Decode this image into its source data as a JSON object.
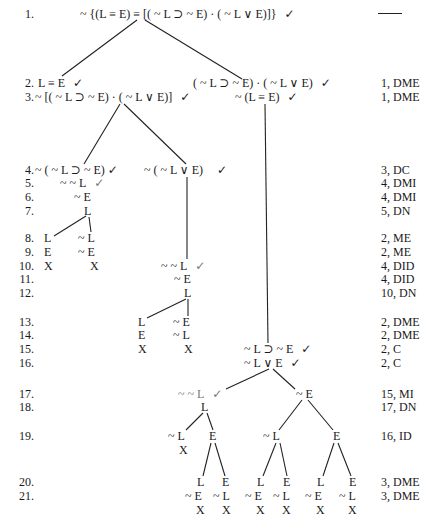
{
  "check_glyph": "✓",
  "rows": [
    {
      "n": "1.",
      "just": ""
    },
    {
      "n": "2.",
      "just": "1, DME"
    },
    {
      "n": "3.",
      "just": "1, DME"
    },
    {
      "n": "4.",
      "just": "3, DC"
    },
    {
      "n": "5.",
      "just": "4, DMI"
    },
    {
      "n": "6.",
      "just": "4, DMI"
    },
    {
      "n": "7.",
      "just": "5, DN"
    },
    {
      "n": "8.",
      "just": "2, ME"
    },
    {
      "n": "9.",
      "just": "2, ME"
    },
    {
      "n": "10.",
      "just": "4, DID"
    },
    {
      "n": "11.",
      "just": "4, DID"
    },
    {
      "n": "12.",
      "just": "10, DN"
    },
    {
      "n": "13.",
      "just": "2, DME"
    },
    {
      "n": "14.",
      "just": "2, DME"
    },
    {
      "n": "15.",
      "just": "2, C"
    },
    {
      "n": "16.",
      "just": "2, C"
    },
    {
      "n": "17.",
      "just": "15, MI"
    },
    {
      "n": "18.",
      "just": "17, DN"
    },
    {
      "n": "19.",
      "just": "16, ID"
    },
    {
      "n": "20.",
      "just": "3, DME"
    },
    {
      "n": "21.",
      "just": "3, DME"
    }
  ],
  "formulas": {
    "r1": "~ {(L ≡ E) ≡ [( ~ L ⊃ ~ E) · ( ~ L ∨ E)]}",
    "r2a": "L ≡ E",
    "r2b": "( ~ L ⊃ ~ E) · ( ~ L ∨ E)",
    "r3a": "~ [( ~ L ⊃ ~ E) · ( ~ L ∨ E)]",
    "r3b": "~ (L ≡ E)",
    "r4a": "~ ( ~ L ⊃ ~ E)",
    "r4b": "~ ( ~ L ∨ E)",
    "r5": "~ ~ L",
    "r6": "~ E",
    "r7": "L",
    "r8a": "L",
    "r8b": "~ L",
    "r9a": "E",
    "r9b": "~ E",
    "r10a": "X",
    "r10b": "X",
    "r10c": "~ ~ L",
    "r11": "~ E",
    "r12": "L",
    "r13a": "L",
    "r13b": "~ E",
    "r14a": "E",
    "r14b": "~ L",
    "r15a": "X",
    "r15b": "X",
    "r15c": "~ L ⊃ ~ E",
    "r16": "~ L ∨ E",
    "r17a": "~ ~ L",
    "r17b": "~ E",
    "r18": "L",
    "r19a": "~ L",
    "r19b": "E",
    "r19c": "~ L",
    "r19d": "E",
    "r19x": "X",
    "r20": [
      "L",
      "E",
      "L",
      "E",
      "L",
      "E"
    ],
    "r21": [
      "~ E",
      "~ L",
      "~ E",
      "~ L",
      "~ E",
      "~ L"
    ],
    "r22": [
      "X",
      "X",
      "X",
      "X",
      "X",
      "X"
    ]
  }
}
